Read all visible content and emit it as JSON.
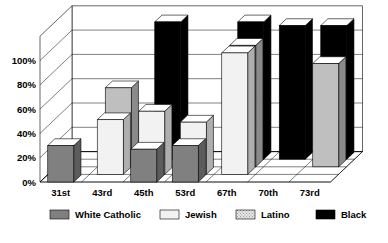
{
  "chart_data": {
    "type": "bar",
    "subtype": "3d-grouped-depth",
    "title": "",
    "xlabel": "",
    "ylabel": "",
    "ylim": [
      0,
      120
    ],
    "grid": true,
    "categories": [
      "31st",
      "43rd",
      "45th",
      "53rd",
      "67th",
      "70th",
      "73rd"
    ],
    "ytick_labels": [
      "0%",
      "20%",
      "40%",
      "60%",
      "80%",
      "100%"
    ],
    "ytick_values": [
      0,
      20,
      40,
      60,
      80,
      100
    ],
    "legend_position": "bottom",
    "series": [
      {
        "name": "White Catholic",
        "color": "#808080",
        "values": [
          30,
          0,
          27,
          30,
          0,
          0,
          0
        ]
      },
      {
        "name": "Jewish",
        "color": "#f2f2f2",
        "values": [
          0,
          45,
          52,
          43,
          100,
          0,
          0
        ]
      },
      {
        "name": "Latino",
        "color": "#bfbfbf",
        "values": [
          0,
          65,
          0,
          0,
          100,
          0,
          85
        ]
      },
      {
        "name": "Black",
        "color": "#000000",
        "values": [
          0,
          0,
          113,
          0,
          113,
          110,
          110
        ]
      }
    ]
  },
  "legend": {
    "items": [
      {
        "label": "White Catholic",
        "swatch": "#808080"
      },
      {
        "label": "Jewish",
        "swatch": "#f2f2f2"
      },
      {
        "label": "Latino",
        "swatch": "#c8c8c8"
      },
      {
        "label": "Black",
        "swatch": "#000000"
      }
    ]
  },
  "colors": {
    "background": "#ffffff",
    "axis": "#000000",
    "wall": "#ffffff",
    "grid": "#000000"
  }
}
